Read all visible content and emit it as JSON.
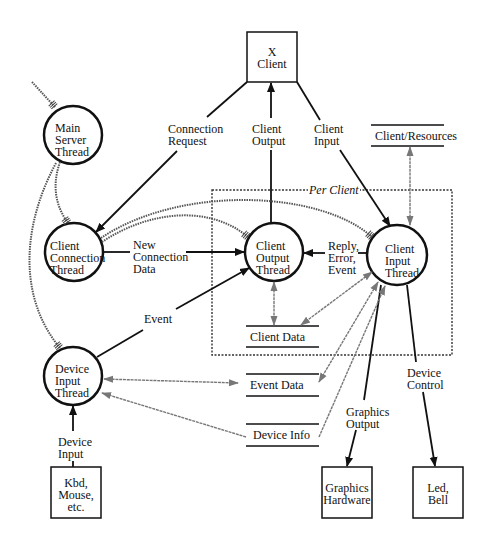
{
  "diagram": {
    "processes": {
      "main_server": "Main\nServer\nThread",
      "client_connection": "Client\nConnection\nThread",
      "device_input": "Device\nInput\nThread",
      "client_output": "Client\nOutput\nThread",
      "client_input": "Client\nInput\nThread"
    },
    "externals": {
      "x_client": "X\nClient",
      "kbd": "Kbd,\nMouse,\netc.",
      "graphics_hw": "Graphics\nHardware",
      "led_bell": "Led,\nBell"
    },
    "stores": {
      "client_resources": "Client/Resources",
      "client_data": "Client Data",
      "event_data": "Event Data",
      "device_info": "Device Info"
    },
    "flows": {
      "connection_request": "Connection\nRequest",
      "client_output": "Client\nOutput",
      "client_input": "Client\nInput",
      "new_connection_data": "New\nConnection\nData",
      "reply_error_event": "Reply,\nError,\nEvent",
      "event": "Event",
      "device_input": "Device\nInput",
      "graphics_output": "Graphics\nOutput",
      "device_control": "Device\nControl"
    },
    "group": {
      "per_client": "Per Client"
    },
    "colors": {
      "line": "#111111",
      "dotted": "#555555",
      "store_arrow": "#666666"
    }
  }
}
